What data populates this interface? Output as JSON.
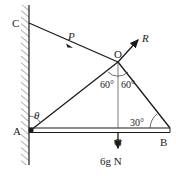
{
  "diagram": {
    "type": "statics-force-diagram",
    "points": {
      "C": {
        "label": "C"
      },
      "O": {
        "label": "O"
      },
      "A": {
        "label": "A"
      },
      "B": {
        "label": "B"
      },
      "G": {
        "label": "G"
      }
    },
    "forces": {
      "P": {
        "label": "P"
      },
      "R": {
        "label": "R"
      },
      "W": {
        "label": "6g N"
      }
    },
    "angles": {
      "theta": {
        "label": "θ"
      },
      "left_at_O": {
        "label": "60°"
      },
      "right_at_O": {
        "label": "60°"
      },
      "at_B": {
        "label": "30°"
      }
    },
    "colors": {
      "line": "#1a1a1a",
      "hatch": "#555555"
    }
  }
}
